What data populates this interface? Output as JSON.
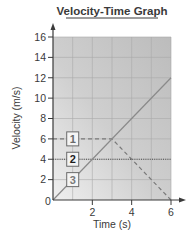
{
  "chart_data": {
    "type": "line",
    "title": "Velocity-Time Graph",
    "xlabel": "Time (s)",
    "ylabel": "Velocity (m/s)",
    "xlim": [
      0,
      6
    ],
    "ylim": [
      0,
      16
    ],
    "x_ticks": [
      2,
      4,
      6
    ],
    "y_ticks": [
      2,
      4,
      6,
      8,
      10,
      12,
      14,
      16
    ],
    "origin_label": "0",
    "grid": true,
    "legend_position": "inline boxed numeric labels near y-axis",
    "series": [
      {
        "name": "1",
        "style": "dashed",
        "color": "#7a7a7a",
        "x": [
          0,
          3,
          6
        ],
        "y": [
          6,
          6,
          0
        ]
      },
      {
        "name": "2",
        "style": "dotted",
        "color": "#4a4a4a",
        "x": [
          0,
          6
        ],
        "y": [
          4,
          4
        ]
      },
      {
        "name": "3",
        "style": "solid",
        "color": "#8a8a8a",
        "x": [
          0,
          6
        ],
        "y": [
          0,
          12
        ]
      }
    ],
    "annotations": [
      {
        "text": "1",
        "x": 0.85,
        "y": 6,
        "boxed": true
      },
      {
        "text": "2",
        "x": 0.85,
        "y": 4,
        "boxed": true
      },
      {
        "text": "3",
        "x": 0.85,
        "y": 2,
        "boxed": true
      }
    ]
  },
  "colors": {
    "plot_bg_dark": "#bdbdbd",
    "plot_bg_light": "#ececec",
    "grid": "#a9a9a9",
    "axis": "#3a3a3a",
    "text": "#3a3a3a"
  }
}
